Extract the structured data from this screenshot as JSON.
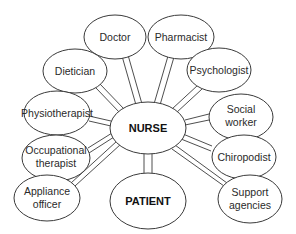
{
  "diagram": {
    "type": "hub-and-spoke",
    "center": {
      "id": "nurse",
      "label": "NURSE"
    },
    "patient": {
      "id": "patient",
      "label": "PATIENT"
    },
    "nodes": [
      {
        "id": "doctor",
        "lines": [
          "Doctor"
        ]
      },
      {
        "id": "pharmacist",
        "lines": [
          "Pharmacist"
        ]
      },
      {
        "id": "dietician",
        "lines": [
          "Dietician"
        ]
      },
      {
        "id": "psychologist",
        "lines": [
          "Psychologist"
        ]
      },
      {
        "id": "physiotherapist",
        "lines": [
          "Physiotherapist"
        ]
      },
      {
        "id": "social-worker",
        "lines": [
          "Social",
          "worker"
        ]
      },
      {
        "id": "occupational-therapist",
        "lines": [
          "Occupational",
          "therapist"
        ]
      },
      {
        "id": "chiropodist",
        "lines": [
          "Chiropodist"
        ]
      },
      {
        "id": "appliance-officer",
        "lines": [
          "Appliance",
          "officer"
        ]
      },
      {
        "id": "support-agencies",
        "lines": [
          "Support",
          "agencies"
        ]
      }
    ],
    "edges": [
      [
        "nurse",
        "doctor"
      ],
      [
        "nurse",
        "pharmacist"
      ],
      [
        "nurse",
        "dietician"
      ],
      [
        "nurse",
        "psychologist"
      ],
      [
        "nurse",
        "physiotherapist"
      ],
      [
        "nurse",
        "social-worker"
      ],
      [
        "nurse",
        "occupational-therapist"
      ],
      [
        "nurse",
        "chiropodist"
      ],
      [
        "nurse",
        "appliance-officer"
      ],
      [
        "nurse",
        "support-agencies"
      ],
      [
        "nurse",
        "patient"
      ]
    ],
    "colors": {
      "stroke": "#3a3a3a",
      "fill": "#ffffff",
      "text": "#2a2a2a"
    }
  }
}
